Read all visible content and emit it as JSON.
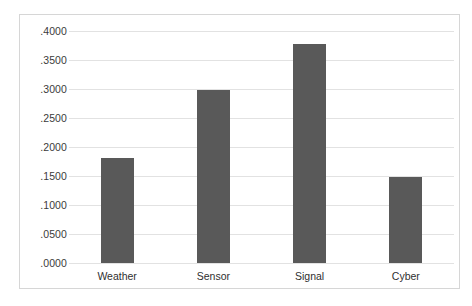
{
  "chart_data": {
    "type": "bar",
    "title": "",
    "subtitle": "",
    "xlabel": "",
    "ylabel": "",
    "categories": [
      "Weather",
      "Sensor",
      "Signal",
      "Cyber"
    ],
    "values": [
      0.181,
      0.298,
      0.378,
      0.148
    ],
    "series": [
      {
        "name": "",
        "values": [
          0.181,
          0.298,
          0.378,
          0.148
        ]
      }
    ],
    "ylim": [
      0.0,
      0.4
    ],
    "y_tick_labels": [
      ".4000",
      ".3500",
      ".3000",
      ".2500",
      ".2000",
      ".1500",
      ".1000",
      ".0500",
      ".0000"
    ],
    "y_tick_values": [
      0.4,
      0.35,
      0.3,
      0.25,
      0.2,
      0.15,
      0.1,
      0.05,
      0.0
    ],
    "grid": true,
    "grid_axis": "y",
    "legend": false,
    "legend_position": "none",
    "bar_color": "#595959",
    "gridline_color": "#e2e2e2",
    "border_color": "#d6d6d6",
    "background_color": "#ffffff",
    "annotations": []
  }
}
